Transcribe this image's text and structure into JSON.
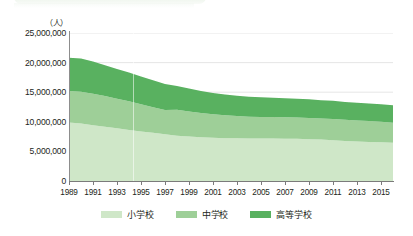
{
  "page": {
    "background_color": "#ffffff",
    "top_bleed_note": "faint cut-off rounded bar from element above"
  },
  "axis": {
    "unit_label": "（人）",
    "y_ticks": [
      "25,000,000",
      "20,000,000",
      "15,000,000",
      "10,000,000",
      "5,000,000",
      "0"
    ],
    "x_ticks": [
      "1989",
      "1991",
      "1993",
      "1995",
      "1997",
      "1999",
      "2001",
      "2003",
      "2005",
      "2007",
      "2009",
      "2011",
      "2013",
      "2015"
    ]
  },
  "legend": {
    "items": [
      {
        "label": "小学校",
        "color": "#cfe7c8"
      },
      {
        "label": "中学校",
        "color": "#9ecf98"
      },
      {
        "label": "高等学校",
        "color": "#59b160"
      }
    ]
  },
  "colors": {
    "elementary": "#cfe7c8",
    "junior_high": "#9ecf98",
    "high_school": "#59b160",
    "axis": "#7b7b7b",
    "grid": "#e3e3e3",
    "text": "#231f20"
  },
  "chart_data": {
    "type": "area",
    "stacked": true,
    "title": "",
    "subtitle": "",
    "xlabel": "",
    "ylabel": "（人）",
    "ylim": [
      0,
      25000000
    ],
    "xlim": [
      1989,
      2016
    ],
    "grid": true,
    "legend_position": "bottom-center",
    "x": [
      1989,
      1990,
      1991,
      1992,
      1993,
      1994,
      1995,
      1996,
      1997,
      1998,
      1999,
      2000,
      2001,
      2002,
      2003,
      2004,
      2005,
      2006,
      2007,
      2008,
      2009,
      2010,
      2011,
      2012,
      2013,
      2014,
      2015,
      2016
    ],
    "series": [
      {
        "name": "小学校",
        "color": "#cfe7c8",
        "values": [
          9900000,
          9700000,
          9430000,
          9160000,
          8890000,
          8620000,
          8380000,
          8150000,
          7910000,
          7660000,
          7500000,
          7370000,
          7300000,
          7240000,
          7230000,
          7200000,
          7190000,
          7190000,
          7130000,
          7120000,
          7060000,
          6990000,
          6890000,
          6760000,
          6680000,
          6600000,
          6540000,
          6450000
        ]
      },
      {
        "name": "中学校",
        "color": "#9ecf98",
        "values": [
          5310000,
          5370000,
          5290000,
          5190000,
          5010000,
          4850000,
          4570000,
          4310000,
          4100000,
          4380000,
          4240000,
          4100000,
          3990000,
          3860000,
          3750000,
          3660000,
          3630000,
          3600000,
          3620000,
          3590000,
          3600000,
          3560000,
          3570000,
          3570000,
          3550000,
          3520000,
          3480000,
          3410000
        ]
      },
      {
        "name": "高等学校",
        "color": "#59b160",
        "values": [
          5600000,
          5620000,
          5450000,
          5220000,
          5010000,
          4850000,
          4720000,
          4550000,
          4370000,
          3990000,
          3880000,
          3720000,
          3580000,
          3500000,
          3410000,
          3360000,
          3320000,
          3280000,
          3240000,
          3200000,
          3150000,
          3100000,
          3080000,
          3030000,
          3000000,
          2970000,
          2940000,
          2930000
        ]
      }
    ],
    "totals": [
      20810000,
      20690000,
      20170000,
      19570000,
      18910000,
      18320000,
      17670000,
      17010000,
      16380000,
      16030000,
      15620000,
      15190000,
      14870000,
      14600000,
      14390000,
      14220000,
      14140000,
      14070000,
      13990000,
      13910000,
      13810000,
      13650000,
      13540000,
      13360000,
      13230000,
      13090000,
      12960000,
      12790000
    ]
  }
}
